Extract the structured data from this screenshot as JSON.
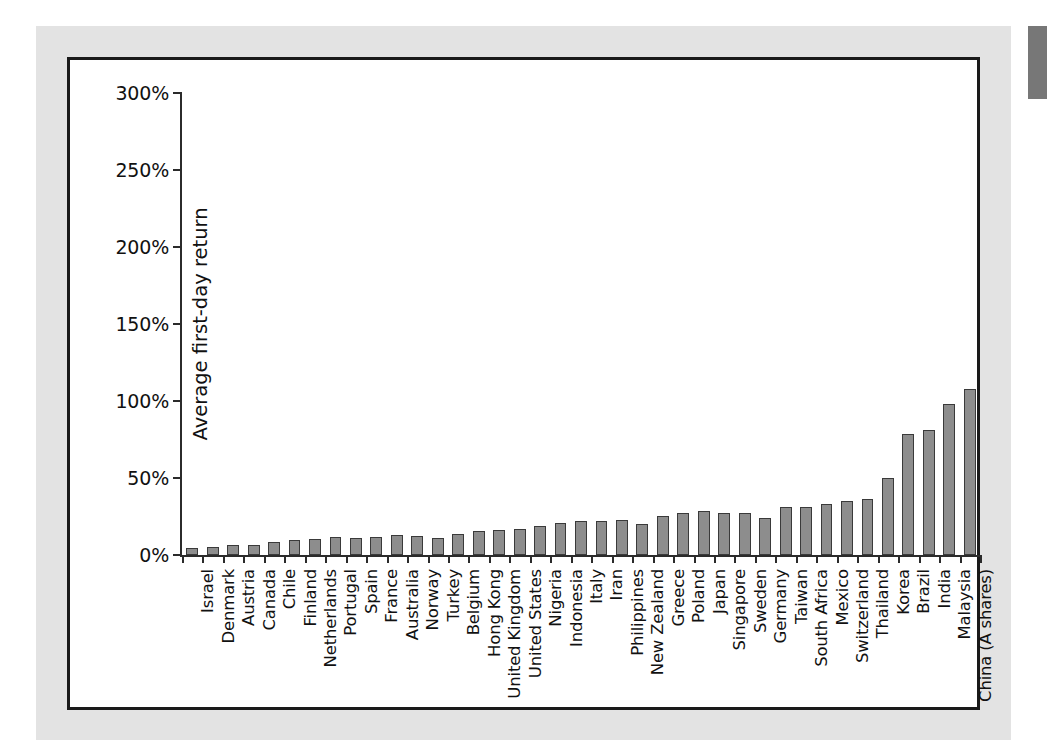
{
  "figure": {
    "background_color": "#e3e3e3",
    "frame_color": "#1a1a1a",
    "bar_fill_color": "#8d8d8d",
    "bar_edge_color": "#3a3a3a"
  },
  "chart_data": {
    "type": "bar",
    "title": "",
    "xlabel": "",
    "ylabel": "Average first-day return",
    "ylim": [
      0,
      300
    ],
    "ytick_labels": [
      "0%",
      "50%",
      "100%",
      "150%",
      "200%",
      "250%",
      "300%"
    ],
    "ytick_values": [
      0,
      50,
      100,
      150,
      200,
      250,
      300
    ],
    "grid": false,
    "legend": null,
    "value_unit": "percent",
    "categories": [
      "Israel",
      "Denmark",
      "Austria",
      "Canada",
      "Chile",
      "Finland",
      "Netherlands",
      "Portugal",
      "Spain",
      "France",
      "Australia",
      "Norway",
      "Turkey",
      "Belgium",
      "Hong Kong",
      "United Kingdom",
      "United States",
      "Nigeria",
      "Indonesia",
      "Italy",
      "Iran",
      "Philippines",
      "New Zealand",
      "Greece",
      "Poland",
      "Japan",
      "Singapore",
      "Sweden",
      "Germany",
      "Taiwan",
      "South Africa",
      "Mexico",
      "Switzerland",
      "Thailand",
      "Korea",
      "Brazil",
      "India",
      "Malaysia",
      "China (A shares)"
    ],
    "values": [
      4.5,
      5.4,
      6.3,
      6.5,
      8.4,
      9.7,
      10.2,
      11.6,
      10.9,
      11.6,
      13.0,
      12.5,
      10.8,
      13.5,
      15.9,
      16.3,
      16.9,
      19.1,
      21.1,
      21.9,
      22.4,
      22.7,
      20.3,
      25.1,
      27.4,
      28.4,
      27.4,
      27.3,
      24.2,
      31.1,
      31.0,
      33.0,
      34.9,
      36.6,
      50.2,
      78.5,
      81.0,
      98.2,
      107.6
    ]
  }
}
